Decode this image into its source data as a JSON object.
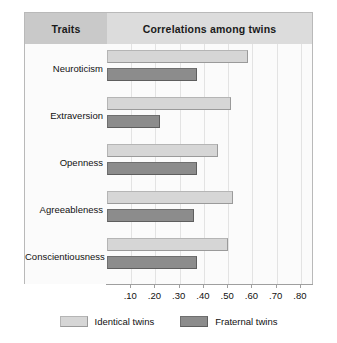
{
  "header": {
    "traits_label": "Traits",
    "correlations_label": "Correlations among twins"
  },
  "legend": {
    "identical_label": "Identical twins",
    "fraternal_label": "Fraternal twins"
  },
  "colors": {
    "identical": "#d6d6d6",
    "fraternal": "#8c8c8c",
    "header_traits_bg": "#c9c9c9",
    "header_corr_bg": "#dcdcdc",
    "gridline": "#e3e3e3",
    "frame_border": "#b9b9b9"
  },
  "chart_data": {
    "type": "bar",
    "title": "Correlations among twins",
    "orientation": "horizontal",
    "xlabel": "",
    "ylabel": "Traits",
    "xlim": [
      0,
      0.85
    ],
    "grid": true,
    "legend_position": "bottom",
    "categories": [
      "Neuroticism",
      "Extraversion",
      "Openness",
      "Agreeableness",
      "Conscientiousness"
    ],
    "tick_labels": [
      ".10",
      ".20",
      ".30",
      ".40",
      ".50",
      ".60",
      ".70",
      ".80"
    ],
    "tick_values": [
      0.1,
      0.2,
      0.3,
      0.4,
      0.5,
      0.6,
      0.7,
      0.8
    ],
    "series": [
      {
        "name": "Identical twins",
        "color": "#d6d6d6",
        "values": [
          0.58,
          0.51,
          0.46,
          0.52,
          0.5
        ]
      },
      {
        "name": "Fraternal twins",
        "color": "#8c8c8c",
        "values": [
          0.37,
          0.22,
          0.37,
          0.36,
          0.37
        ]
      }
    ]
  }
}
